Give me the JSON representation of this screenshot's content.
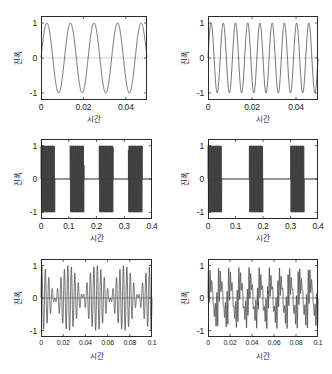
{
  "figure": {
    "background": "#ffffff",
    "line_color": "#262626",
    "axis_color": "#2b2b2b",
    "rows": 3,
    "cols": 2
  },
  "chart_data": [
    {
      "id": "top-left",
      "type": "line",
      "title": "",
      "xlabel": "시간",
      "ylabel": "진폭",
      "xlim": [
        0,
        0.05
      ],
      "ylim": [
        -1.2,
        1.2
      ],
      "xticks": [
        0,
        0.02,
        0.04
      ],
      "xticklabels": [
        "0",
        "0.02",
        "0.04"
      ],
      "yticks": [
        -1,
        0,
        1
      ],
      "yticklabels": [
        "-1",
        "0",
        "1"
      ],
      "grid": false,
      "zero_line": true,
      "series": [
        {
          "name": "sine",
          "waveform": "sine",
          "frequency_hz": 90,
          "amplitude": 1.0,
          "phase": 0,
          "cycles_visible": 4.5
        }
      ]
    },
    {
      "id": "top-right",
      "type": "line",
      "title": "",
      "xlabel": "시간",
      "ylabel": "진폭",
      "xlim": [
        0,
        0.05
      ],
      "ylim": [
        -1.2,
        1.2
      ],
      "xticks": [
        0,
        0.02,
        0.04
      ],
      "xticklabels": [
        "0",
        "0.02",
        "0.04"
      ],
      "yticks": [
        -1,
        0,
        1
      ],
      "yticklabels": [
        "-1",
        "0",
        "1"
      ],
      "grid": false,
      "zero_line": true,
      "series": [
        {
          "name": "sine",
          "waveform": "sine",
          "frequency_hz": 180,
          "amplitude": 1.0,
          "phase": 0,
          "cycles_visible": 9
        }
      ]
    },
    {
      "id": "middle-left",
      "type": "line",
      "title": "",
      "xlabel": "시간",
      "ylabel": "진폭",
      "xlim": [
        0,
        0.4
      ],
      "ylim": [
        -1.2,
        1.2
      ],
      "xticks": [
        0,
        0.1,
        0.2,
        0.3,
        0.4
      ],
      "xticklabels": [
        "0",
        "0.1",
        "0.2",
        "0.3",
        "0.4"
      ],
      "yticks": [
        -1,
        0,
        1
      ],
      "yticklabels": [
        "-1",
        "0",
        "1"
      ],
      "grid": false,
      "zero_line": true,
      "series": [
        {
          "name": "gated-tone-bursts",
          "waveform": "burst",
          "carrier_hz": 420,
          "amplitude": 1.0,
          "burst_count": 4,
          "burst_starts": [
            0.0,
            0.105,
            0.21,
            0.315
          ],
          "burst_width": 0.05
        }
      ]
    },
    {
      "id": "middle-right",
      "type": "line",
      "title": "",
      "xlabel": "시간",
      "ylabel": "진폭",
      "xlim": [
        0,
        0.4
      ],
      "ylim": [
        -1.2,
        1.2
      ],
      "xticks": [
        0,
        0.1,
        0.2,
        0.3,
        0.4
      ],
      "xticklabels": [
        "0",
        "0.1",
        "0.2",
        "0.3",
        "0.4"
      ],
      "yticks": [
        -1,
        0,
        1
      ],
      "yticklabels": [
        "-1",
        "0",
        "1"
      ],
      "grid": false,
      "zero_line": true,
      "series": [
        {
          "name": "gated-tone-bursts",
          "waveform": "burst",
          "carrier_hz": 420,
          "amplitude": 1.0,
          "burst_count": 3,
          "burst_starts": [
            0.0,
            0.15,
            0.3
          ],
          "burst_width": 0.05
        }
      ]
    },
    {
      "id": "bottom-left",
      "type": "line",
      "title": "",
      "xlabel": "시간",
      "ylabel": "진폭",
      "xlim": [
        0,
        0.1
      ],
      "ylim": [
        -1.2,
        1.2
      ],
      "xticks": [
        0,
        0.02,
        0.04,
        0.06,
        0.08,
        0.1
      ],
      "xticklabels": [
        "0",
        "0.02",
        "0.04",
        "0.06",
        "0.08",
        "0.1"
      ],
      "yticks": [
        -1,
        0,
        1
      ],
      "yticklabels": [
        "-1",
        "0",
        "1"
      ],
      "grid": false,
      "zero_line": true,
      "series": [
        {
          "name": "beat",
          "waveform": "beat",
          "carrier_hz": 320,
          "modulation_hz": 40,
          "amplitude": 1.0,
          "beat_nodes": [
            0.0125,
            0.0375,
            0.0625,
            0.0875
          ],
          "beat_count": 4
        }
      ]
    },
    {
      "id": "bottom-right",
      "type": "line",
      "title": "",
      "xlabel": "시간",
      "ylabel": "진폭",
      "xlim": [
        0,
        0.1
      ],
      "ylim": [
        -1.2,
        1.2
      ],
      "xticks": [
        0,
        0.02,
        0.04,
        0.06,
        0.08,
        0.1
      ],
      "xticklabels": [
        "0",
        "0.02",
        "0.04",
        "0.06",
        "0.08",
        "0.1"
      ],
      "yticks": [
        -1,
        0,
        1
      ],
      "yticklabels": [
        "-1",
        "0",
        "1"
      ],
      "grid": false,
      "zero_line": true,
      "series": [
        {
          "name": "spike-train",
          "waveform": "modulated-spikes",
          "carrier_hz": 650,
          "modulation_hz": 110,
          "amplitude": 1.0,
          "peak_count": 11
        }
      ]
    }
  ]
}
